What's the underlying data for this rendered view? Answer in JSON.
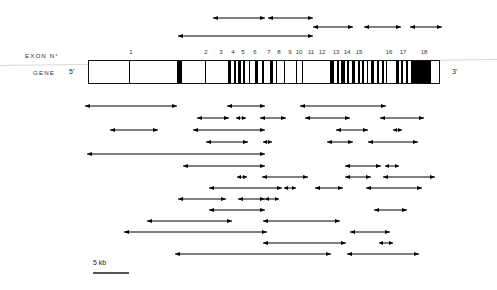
{
  "figure": {
    "scale_bar": {
      "label": "5 kb",
      "x": 93,
      "y": 272,
      "width": 36
    },
    "labels": {
      "exon_row_label": "EXON N°",
      "gene_row_label": "GENE",
      "five_prime": "5'",
      "three_prime": "3'"
    },
    "gene_bar": {
      "x": 88,
      "y": 60,
      "width": 352,
      "height": 24
    },
    "exons": [
      {
        "number": "1",
        "label_x": 131,
        "band_x": 129,
        "band_w": 1.2
      },
      {
        "number": "2",
        "label_x": 206,
        "band_x": 177,
        "band_w": 5.0
      },
      {
        "number": "3",
        "label_x": 221,
        "band_x": 205,
        "band_w": 1.2
      },
      {
        "number": "4",
        "label_x": 233,
        "band_x": 228,
        "band_w": 3.0
      },
      {
        "number": "5",
        "label_x": 243,
        "band_x": 234,
        "band_w": 1.6
      },
      {
        "number": "6",
        "label_x": 255,
        "band_x": 238,
        "band_w": 2.6
      },
      {
        "number": "7",
        "label_x": 269,
        "band_x": 243,
        "band_w": 2.2
      },
      {
        "number": "8",
        "label_x": 279,
        "band_x": 249,
        "band_w": 1.4
      },
      {
        "number": "9",
        "label_x": 290,
        "band_x": 255,
        "band_w": 3.4
      },
      {
        "number": "10",
        "label_x": 299,
        "band_x": 262,
        "band_w": 1.6
      },
      {
        "number": "11",
        "label_x": 311,
        "band_x": 270,
        "band_w": 3.0
      },
      {
        "number": "12",
        "label_x": 322,
        "band_x": 276,
        "band_w": 1.4
      },
      {
        "number": "13",
        "label_x": 336,
        "band_x": 284,
        "band_w": 1.2
      },
      {
        "number": "14",
        "label_x": 347,
        "band_x": 296,
        "band_w": 1.2
      },
      {
        "number": "15",
        "label_x": 359,
        "band_x": 302,
        "band_w": 1.2
      },
      {
        "number": "16",
        "label_x": 389,
        "band_x": 330,
        "band_w": 4.2
      },
      {
        "number": "17",
        "label_x": 403,
        "band_x": 337,
        "band_w": 2.0
      },
      {
        "number": "18",
        "label_x": 424,
        "band_x": 341,
        "band_w": 4.0
      }
    ],
    "extra_bands": [
      {
        "x": 347,
        "w": 2.0
      },
      {
        "x": 352,
        "w": 3.2
      },
      {
        "x": 358,
        "w": 1.6
      },
      {
        "x": 362,
        "w": 2.4
      },
      {
        "x": 367,
        "w": 1.4
      },
      {
        "x": 371,
        "w": 3.0
      },
      {
        "x": 377,
        "w": 1.6
      },
      {
        "x": 382,
        "w": 2.2
      },
      {
        "x": 386,
        "w": 1.4
      },
      {
        "x": 396,
        "w": 2.8
      },
      {
        "x": 401,
        "w": 1.6
      },
      {
        "x": 406,
        "w": 2.0
      },
      {
        "x": 411,
        "w": 20.0
      }
    ],
    "arrows_above": [
      {
        "x": 213,
        "w": 52,
        "y": 18
      },
      {
        "x": 268,
        "w": 45,
        "y": 18
      },
      {
        "x": 178,
        "w": 135,
        "y": 36
      },
      {
        "x": 313,
        "w": 40,
        "y": 27
      },
      {
        "x": 364,
        "w": 37,
        "y": 27
      },
      {
        "x": 410,
        "w": 32,
        "y": 27
      }
    ],
    "arrows_below": [
      {
        "x": 85,
        "w": 92,
        "y": 106
      },
      {
        "x": 227,
        "w": 38,
        "y": 106
      },
      {
        "x": 300,
        "w": 86,
        "y": 106
      },
      {
        "x": 197,
        "w": 32,
        "y": 118
      },
      {
        "x": 236,
        "w": 10,
        "y": 118
      },
      {
        "x": 260,
        "w": 26,
        "y": 118
      },
      {
        "x": 305,
        "w": 45,
        "y": 118
      },
      {
        "x": 380,
        "w": 44,
        "y": 118
      },
      {
        "x": 110,
        "w": 48,
        "y": 130
      },
      {
        "x": 193,
        "w": 72,
        "y": 130
      },
      {
        "x": 336,
        "w": 32,
        "y": 130
      },
      {
        "x": 393,
        "w": 9,
        "y": 130
      },
      {
        "x": 206,
        "w": 42,
        "y": 142
      },
      {
        "x": 263,
        "w": 9,
        "y": 142
      },
      {
        "x": 327,
        "w": 26,
        "y": 142
      },
      {
        "x": 368,
        "w": 50,
        "y": 142
      },
      {
        "x": 87,
        "w": 178,
        "y": 154
      },
      {
        "x": 183,
        "w": 82,
        "y": 166
      },
      {
        "x": 345,
        "w": 36,
        "y": 166
      },
      {
        "x": 385,
        "w": 14,
        "y": 166
      },
      {
        "x": 237,
        "w": 10,
        "y": 177
      },
      {
        "x": 262,
        "w": 46,
        "y": 177
      },
      {
        "x": 345,
        "w": 26,
        "y": 177
      },
      {
        "x": 383,
        "w": 52,
        "y": 177
      },
      {
        "x": 209,
        "w": 73,
        "y": 188
      },
      {
        "x": 284,
        "w": 12,
        "y": 188
      },
      {
        "x": 315,
        "w": 28,
        "y": 188
      },
      {
        "x": 366,
        "w": 56,
        "y": 188
      },
      {
        "x": 178,
        "w": 48,
        "y": 199
      },
      {
        "x": 238,
        "w": 27,
        "y": 199
      },
      {
        "x": 265,
        "w": 14,
        "y": 199
      },
      {
        "x": 209,
        "w": 56,
        "y": 210
      },
      {
        "x": 374,
        "w": 33,
        "y": 210
      },
      {
        "x": 147,
        "w": 85,
        "y": 221
      },
      {
        "x": 263,
        "w": 77,
        "y": 221
      },
      {
        "x": 124,
        "w": 143,
        "y": 232
      },
      {
        "x": 350,
        "w": 40,
        "y": 232
      },
      {
        "x": 263,
        "w": 83,
        "y": 243
      },
      {
        "x": 379,
        "w": 14,
        "y": 243
      },
      {
        "x": 175,
        "w": 156,
        "y": 254
      },
      {
        "x": 347,
        "w": 72,
        "y": 254
      }
    ]
  }
}
